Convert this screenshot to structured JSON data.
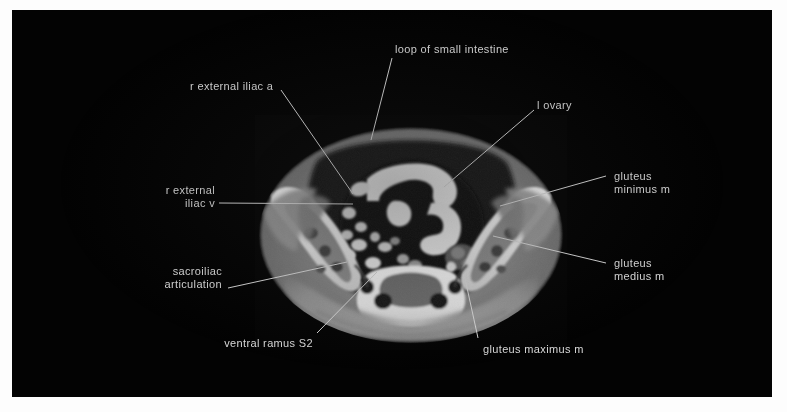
{
  "figure": {
    "modality": "CT",
    "plane": "axial",
    "region": "pelvis",
    "background_color": "#030303",
    "label_color": "#d9d9d9",
    "leader_color": "#d8d8d8"
  },
  "labels": [
    {
      "id": "loop-of-small-intestine",
      "text": "loop of small intestine",
      "lines": [
        "loop of small intestine"
      ],
      "align": "left",
      "text_x": 395,
      "text_y": 43,
      "leader": {
        "x1": 392,
        "y1": 58,
        "x2": 371,
        "y2": 140
      }
    },
    {
      "id": "r-external-iliac-a",
      "text": "r external iliac a",
      "lines": [
        "r external iliac a"
      ],
      "align": "left",
      "text_x": 190,
      "text_y": 80,
      "leader": {
        "x1": 281,
        "y1": 90,
        "x2": 353,
        "y2": 194
      }
    },
    {
      "id": "l-ovary",
      "text": "l ovary",
      "lines": [
        "l ovary"
      ],
      "align": "left",
      "text_x": 537,
      "text_y": 99,
      "leader": {
        "x1": 534,
        "y1": 110,
        "x2": 444,
        "y2": 187
      }
    },
    {
      "id": "gluteus-minimus-m",
      "text": "gluteus minimus m",
      "lines": [
        "gluteus",
        "minimus m"
      ],
      "align": "left",
      "text_x": 614,
      "text_y": 170,
      "leader": {
        "x1": 606,
        "y1": 176,
        "x2": 500,
        "y2": 206
      }
    },
    {
      "id": "r-external-iliac-v",
      "text": "r external iliac v",
      "lines": [
        "r external",
        "iliac v"
      ],
      "align": "right",
      "text_x": 215,
      "text_y": 184,
      "leader": {
        "x1": 219,
        "y1": 203,
        "x2": 353,
        "y2": 204
      }
    },
    {
      "id": "gluteus-medius-m",
      "text": "gluteus medius m",
      "lines": [
        "gluteus",
        "medius m"
      ],
      "align": "left",
      "text_x": 614,
      "text_y": 257,
      "leader": {
        "x1": 606,
        "y1": 263,
        "x2": 493,
        "y2": 236
      }
    },
    {
      "id": "sacroiliac-articulation",
      "text": "sacroiliac articulation",
      "lines": [
        "sacroiliac",
        "articulation"
      ],
      "align": "right",
      "text_x": 222,
      "text_y": 265,
      "leader": {
        "x1": 228,
        "y1": 288,
        "x2": 347,
        "y2": 262
      }
    },
    {
      "id": "ventral-ramus-s2",
      "text": "ventral ramus S2",
      "lines": [
        "ventral ramus S2"
      ],
      "align": "right",
      "text_x": 313,
      "text_y": 337,
      "leader": {
        "x1": 317,
        "y1": 333,
        "x2": 377,
        "y2": 272
      }
    },
    {
      "id": "gluteus-maximus-m",
      "text": "gluteus maximus m",
      "lines": [
        "gluteus maximus m"
      ],
      "align": "left",
      "text_x": 483,
      "text_y": 343,
      "leader": {
        "x1": 478,
        "y1": 338,
        "x2": 464,
        "y2": 274
      }
    }
  ]
}
